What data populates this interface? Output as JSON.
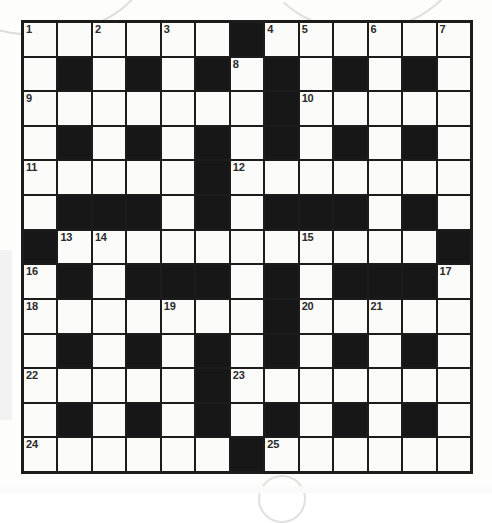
{
  "puzzle": {
    "type": "crossword-grid",
    "rows": 13,
    "cols": 13,
    "colors": {
      "black_square": "#171717",
      "white_square": "#fbfbf9",
      "grid_line": "#1c1c1c",
      "number_text": "#2a2a2a",
      "page_background": "#fdfdfc"
    },
    "grid": [
      [
        "W",
        "W",
        "W",
        "W",
        "W",
        "W",
        "B",
        "W",
        "W",
        "W",
        "W",
        "W",
        "W"
      ],
      [
        "W",
        "B",
        "W",
        "B",
        "W",
        "B",
        "W",
        "B",
        "W",
        "B",
        "W",
        "B",
        "W"
      ],
      [
        "W",
        "W",
        "W",
        "W",
        "W",
        "W",
        "W",
        "B",
        "W",
        "W",
        "W",
        "W",
        "W"
      ],
      [
        "W",
        "B",
        "W",
        "B",
        "W",
        "B",
        "W",
        "B",
        "W",
        "B",
        "W",
        "B",
        "W"
      ],
      [
        "W",
        "W",
        "W",
        "W",
        "W",
        "B",
        "W",
        "W",
        "W",
        "W",
        "W",
        "W",
        "W"
      ],
      [
        "W",
        "B",
        "B",
        "B",
        "W",
        "B",
        "W",
        "B",
        "B",
        "B",
        "W",
        "B",
        "W"
      ],
      [
        "B",
        "W",
        "W",
        "W",
        "W",
        "W",
        "W",
        "W",
        "W",
        "W",
        "W",
        "W",
        "B"
      ],
      [
        "W",
        "B",
        "W",
        "B",
        "B",
        "B",
        "W",
        "B",
        "W",
        "B",
        "B",
        "B",
        "W"
      ],
      [
        "W",
        "W",
        "W",
        "W",
        "W",
        "W",
        "W",
        "B",
        "W",
        "W",
        "W",
        "W",
        "W"
      ],
      [
        "W",
        "B",
        "W",
        "B",
        "W",
        "B",
        "W",
        "B",
        "W",
        "B",
        "W",
        "B",
        "W"
      ],
      [
        "W",
        "W",
        "W",
        "W",
        "W",
        "B",
        "W",
        "W",
        "W",
        "W",
        "W",
        "W",
        "W"
      ],
      [
        "W",
        "B",
        "W",
        "B",
        "W",
        "B",
        "W",
        "B",
        "W",
        "B",
        "W",
        "B",
        "W"
      ],
      [
        "W",
        "W",
        "W",
        "W",
        "W",
        "W",
        "B",
        "W",
        "W",
        "W",
        "W",
        "W",
        "W"
      ]
    ],
    "numbers": [
      {
        "row": 0,
        "col": 0,
        "label": "1"
      },
      {
        "row": 0,
        "col": 2,
        "label": "2"
      },
      {
        "row": 0,
        "col": 4,
        "label": "3"
      },
      {
        "row": 0,
        "col": 7,
        "label": "4"
      },
      {
        "row": 0,
        "col": 8,
        "label": "5"
      },
      {
        "row": 0,
        "col": 10,
        "label": "6"
      },
      {
        "row": 0,
        "col": 12,
        "label": "7"
      },
      {
        "row": 1,
        "col": 6,
        "label": "8"
      },
      {
        "row": 2,
        "col": 0,
        "label": "9"
      },
      {
        "row": 2,
        "col": 8,
        "label": "10"
      },
      {
        "row": 4,
        "col": 0,
        "label": "11"
      },
      {
        "row": 4,
        "col": 6,
        "label": "12"
      },
      {
        "row": 6,
        "col": 1,
        "label": "13"
      },
      {
        "row": 6,
        "col": 2,
        "label": "14"
      },
      {
        "row": 6,
        "col": 8,
        "label": "15"
      },
      {
        "row": 7,
        "col": 0,
        "label": "16"
      },
      {
        "row": 7,
        "col": 12,
        "label": "17"
      },
      {
        "row": 8,
        "col": 0,
        "label": "18"
      },
      {
        "row": 8,
        "col": 4,
        "label": "19"
      },
      {
        "row": 8,
        "col": 8,
        "label": "20"
      },
      {
        "row": 8,
        "col": 10,
        "label": "21"
      },
      {
        "row": 10,
        "col": 0,
        "label": "22"
      },
      {
        "row": 10,
        "col": 6,
        "label": "23"
      },
      {
        "row": 12,
        "col": 0,
        "label": "24"
      },
      {
        "row": 12,
        "col": 7,
        "label": "25"
      }
    ],
    "entries": []
  }
}
